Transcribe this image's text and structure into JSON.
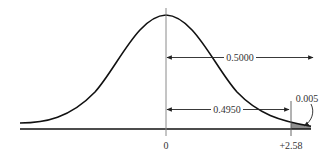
{
  "diagram": {
    "type": "normal-distribution-curve",
    "colors": {
      "curve": "#111111",
      "axis": "#111111",
      "mean_line": "#8a8a8a",
      "shaded_tail": "#8f8f8f",
      "text": "#333333"
    },
    "axis_labels": {
      "mean": "0",
      "critical_value": "+2.58"
    },
    "areas": {
      "right_half": "0.5000",
      "mean_to_critical": "0.4950",
      "tail": "0.005"
    }
  }
}
